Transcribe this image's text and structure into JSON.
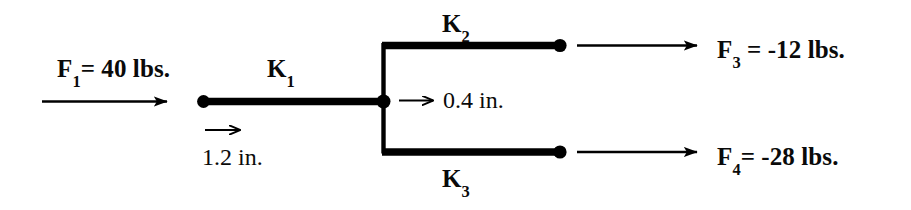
{
  "diagram": {
    "background_color": "#ffffff",
    "stroke_color": "#000000",
    "labels": {
      "force_1": {
        "symbol": "F",
        "subscript": "1",
        "text": "= 40 lbs.",
        "full": "F1= 40 lbs."
      },
      "force_3": {
        "symbol": "F",
        "subscript": "3",
        "text": " = -12 lbs.",
        "full": "F3 = -12 lbs."
      },
      "force_4": {
        "symbol": "F",
        "subscript": "4",
        "text": "= -28 lbs.",
        "full": "F4= -28 lbs."
      },
      "spring_1": {
        "symbol": "K",
        "subscript": "1",
        "full": "K1"
      },
      "spring_2": {
        "symbol": "K",
        "subscript": "2",
        "full": "K2"
      },
      "spring_3": {
        "symbol": "K",
        "subscript": "3",
        "full": "K3"
      },
      "displacement_1": "1.2 in.",
      "displacement_2": "0.4 in."
    },
    "values": {
      "F1_lbs": 40,
      "F3_lbs": -12,
      "F4_lbs": -28,
      "displacement_1_in": 1.2,
      "displacement_2_in": 0.4
    }
  }
}
